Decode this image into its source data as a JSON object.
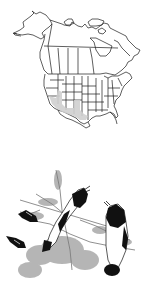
{
  "range_map": {
    "region": "North America",
    "subject": "species range map",
    "range_color": "#cfcfcf",
    "outline_color": "#1a1a1a",
    "shaded_regions": [
      "southern California",
      "southern Nevada",
      "Arizona",
      "New Mexico",
      "southwest Texas",
      "northern Mexico"
    ]
  },
  "illustration": {
    "subject": "two perched birds on a flowering shrub, with a third bird in flight lower left",
    "style": "black-and-white pen illustration",
    "ink_color": "#111111"
  }
}
